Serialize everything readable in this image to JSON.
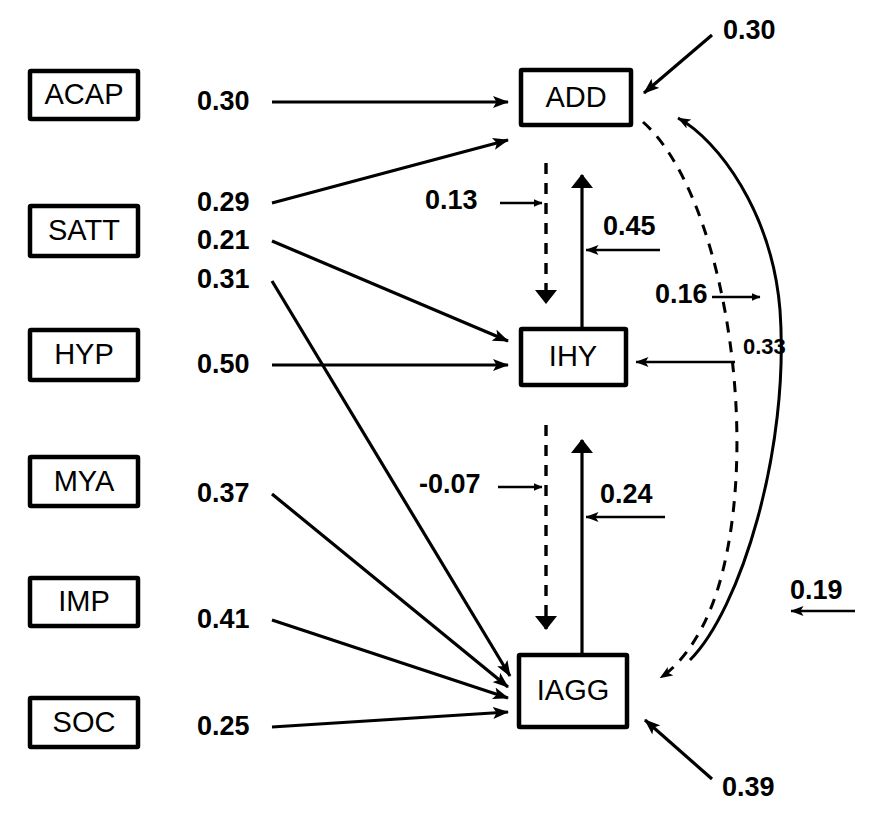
{
  "diagram": {
    "type": "path-diagram",
    "title": "",
    "background_color": "#ffffff",
    "line_color": "#000000"
  },
  "exogenous_boxes": [
    {
      "id": "ACAP",
      "label": "ACAP"
    },
    {
      "id": "SATT",
      "label": "SATT"
    },
    {
      "id": "HYP",
      "label": "HYP"
    },
    {
      "id": "MYA",
      "label": "MYA"
    },
    {
      "id": "IMP",
      "label": "IMP"
    },
    {
      "id": "SOC",
      "label": "SOC"
    }
  ],
  "endogenous_boxes": [
    {
      "id": "ADD",
      "label": "ADD"
    },
    {
      "id": "IHY",
      "label": "IHY"
    },
    {
      "id": "IAGG",
      "label": "IAGG"
    }
  ],
  "path_coefficients": {
    "acap_to_add": "0.30",
    "satt_to_add": "0.29",
    "satt_to_ihy": "0.21",
    "hyp_to_iagg": "0.31",
    "hyp_to_ihy": "0.50",
    "mya_to_iagg": "0.37",
    "imp_to_iagg": "0.41",
    "soc_to_iagg": "0.25",
    "add_to_ihy": "0.13",
    "ihy_to_add": "0.45",
    "ihy_to_iagg": "-0.07",
    "iagg_to_ihy": "0.24",
    "add_to_iagg": "0.16",
    "iagg_to_add": "0.19",
    "disturbance_add": "0.30",
    "disturbance_ihy": "0.33",
    "disturbance_iagg": "0.39"
  },
  "edges": [
    {
      "from": "ACAP",
      "to": "ADD",
      "coefficient": "0.30",
      "style": "solid"
    },
    {
      "from": "SATT",
      "to": "ADD",
      "coefficient": "0.29",
      "style": "solid"
    },
    {
      "from": "SATT",
      "to": "IHY",
      "coefficient": "0.21",
      "style": "solid"
    },
    {
      "from": "HYP",
      "to": "IAGG",
      "coefficient": "0.31",
      "style": "solid"
    },
    {
      "from": "HYP",
      "to": "IHY",
      "coefficient": "0.50",
      "style": "solid"
    },
    {
      "from": "MYA",
      "to": "IAGG",
      "coefficient": "0.37",
      "style": "solid"
    },
    {
      "from": "IMP",
      "to": "IAGG",
      "coefficient": "0.41",
      "style": "solid"
    },
    {
      "from": "SOC",
      "to": "IAGG",
      "coefficient": "0.25",
      "style": "solid"
    },
    {
      "from": "ADD",
      "to": "IHY",
      "coefficient": "0.13",
      "style": "dashed"
    },
    {
      "from": "IHY",
      "to": "ADD",
      "coefficient": "0.45",
      "style": "solid"
    },
    {
      "from": "IHY",
      "to": "IAGG",
      "coefficient": "-0.07",
      "style": "dashed"
    },
    {
      "from": "IAGG",
      "to": "IHY",
      "coefficient": "0.24",
      "style": "solid"
    },
    {
      "from": "ADD",
      "to": "IAGG",
      "coefficient": "0.16",
      "style": "dashed-curve"
    },
    {
      "from": "IAGG",
      "to": "ADD",
      "coefficient": "0.19",
      "style": "solid-curve"
    },
    {
      "from": "disturbance",
      "to": "ADD",
      "coefficient": "0.30",
      "style": "solid"
    },
    {
      "from": "disturbance",
      "to": "IHY",
      "coefficient": "0.33",
      "style": "solid"
    },
    {
      "from": "disturbance",
      "to": "IAGG",
      "coefficient": "0.39",
      "style": "solid"
    }
  ]
}
